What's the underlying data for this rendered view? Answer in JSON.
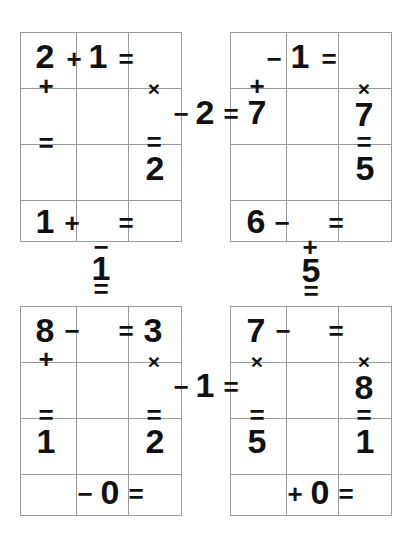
{
  "page": {
    "background_color": "#ffffff",
    "ink_color": "#111111",
    "grid_line_color": "#9a9a9a",
    "width": 411,
    "height": 544
  },
  "blocks": [
    {
      "id": "top-left",
      "rows": 4,
      "cols": 3
    },
    {
      "id": "top-right",
      "rows": 4,
      "cols": 3
    },
    {
      "id": "bottom-left",
      "rows": 4,
      "cols": 3
    },
    {
      "id": "bottom-right",
      "rows": 4,
      "cols": 3
    }
  ],
  "glyphs": [
    {
      "id": "g01",
      "text": "2",
      "kind": "num",
      "x": 45,
      "y": 56,
      "block": "top-left"
    },
    {
      "id": "g02",
      "text": "+",
      "kind": "op",
      "x": 74,
      "y": 59,
      "block": "top-left"
    },
    {
      "id": "g03",
      "text": "1",
      "kind": "num",
      "x": 98,
      "y": 56,
      "block": "top-left"
    },
    {
      "id": "g04",
      "text": "=",
      "kind": "eq",
      "x": 126,
      "y": 59,
      "block": "top-left"
    },
    {
      "id": "g05",
      "text": "+",
      "kind": "op",
      "x": 46,
      "y": 86,
      "block": "top-left"
    },
    {
      "id": "g06",
      "text": "×",
      "kind": "opsm",
      "x": 154,
      "y": 88,
      "block": "top-left"
    },
    {
      "id": "g07",
      "text": "=",
      "kind": "eq",
      "x": 46,
      "y": 143,
      "block": "top-left"
    },
    {
      "id": "g08",
      "text": "=",
      "kind": "eq",
      "x": 154,
      "y": 142,
      "block": "top-left"
    },
    {
      "id": "g09",
      "text": "2",
      "kind": "num",
      "x": 155,
      "y": 168,
      "block": "top-left"
    },
    {
      "id": "g10",
      "text": "1",
      "kind": "num",
      "x": 45,
      "y": 221,
      "block": "top-left"
    },
    {
      "id": "g11",
      "text": "+",
      "kind": "op",
      "x": 72,
      "y": 223,
      "block": "top-left"
    },
    {
      "id": "g12",
      "text": "=",
      "kind": "eq",
      "x": 126,
      "y": 223,
      "block": "top-left"
    },
    {
      "id": "g13",
      "text": "−",
      "kind": "op",
      "x": 274,
      "y": 59,
      "block": "top-right"
    },
    {
      "id": "g14",
      "text": "1",
      "kind": "num",
      "x": 300,
      "y": 56,
      "block": "top-right"
    },
    {
      "id": "g15",
      "text": "=",
      "kind": "eq",
      "x": 329,
      "y": 59,
      "block": "top-right"
    },
    {
      "id": "g16",
      "text": "+",
      "kind": "op",
      "x": 257,
      "y": 86,
      "block": "top-right"
    },
    {
      "id": "g17",
      "text": "×",
      "kind": "opsm",
      "x": 364,
      "y": 88,
      "block": "top-right"
    },
    {
      "id": "g18",
      "text": "7",
      "kind": "num",
      "x": 364,
      "y": 114,
      "block": "top-right"
    },
    {
      "id": "g19",
      "text": "=",
      "kind": "eq",
      "x": 364,
      "y": 142,
      "block": "top-right"
    },
    {
      "id": "g20",
      "text": "5",
      "kind": "num",
      "x": 365,
      "y": 168,
      "block": "top-right"
    },
    {
      "id": "g21",
      "text": "6",
      "kind": "num",
      "x": 256,
      "y": 221,
      "block": "top-right"
    },
    {
      "id": "g22",
      "text": "−",
      "kind": "op",
      "x": 282,
      "y": 223,
      "block": "top-right"
    },
    {
      "id": "g23",
      "text": "=",
      "kind": "eq",
      "x": 336,
      "y": 223,
      "block": "top-right"
    },
    {
      "id": "g24",
      "text": "8",
      "kind": "num",
      "x": 45,
      "y": 330,
      "block": "bottom-left"
    },
    {
      "id": "g25",
      "text": "−",
      "kind": "op",
      "x": 72,
      "y": 331,
      "block": "bottom-left"
    },
    {
      "id": "g26",
      "text": "=",
      "kind": "eq",
      "x": 126,
      "y": 331,
      "block": "bottom-left"
    },
    {
      "id": "g27",
      "text": "3",
      "kind": "num",
      "x": 153,
      "y": 330,
      "block": "bottom-left"
    },
    {
      "id": "g28",
      "text": "+",
      "kind": "op",
      "x": 46,
      "y": 359,
      "block": "bottom-left"
    },
    {
      "id": "g29",
      "text": "×",
      "kind": "opsm",
      "x": 154,
      "y": 361,
      "block": "bottom-left"
    },
    {
      "id": "g30",
      "text": "=",
      "kind": "eq",
      "x": 46,
      "y": 415,
      "block": "bottom-left"
    },
    {
      "id": "g31",
      "text": "1",
      "kind": "num",
      "x": 46,
      "y": 441,
      "block": "bottom-left"
    },
    {
      "id": "g32",
      "text": "=",
      "kind": "eq",
      "x": 154,
      "y": 415,
      "block": "bottom-left"
    },
    {
      "id": "g33",
      "text": "2",
      "kind": "num",
      "x": 155,
      "y": 441,
      "block": "bottom-left"
    },
    {
      "id": "g34",
      "text": "−",
      "kind": "op",
      "x": 85,
      "y": 494,
      "block": "bottom-left"
    },
    {
      "id": "g35",
      "text": "0",
      "kind": "num",
      "x": 110,
      "y": 492,
      "block": "bottom-left"
    },
    {
      "id": "g36",
      "text": "=",
      "kind": "eq",
      "x": 136,
      "y": 494,
      "block": "bottom-left"
    },
    {
      "id": "g37",
      "text": "7",
      "kind": "num",
      "x": 256,
      "y": 330,
      "block": "bottom-right"
    },
    {
      "id": "g38",
      "text": "−",
      "kind": "op",
      "x": 283,
      "y": 331,
      "block": "bottom-right"
    },
    {
      "id": "g39",
      "text": "=",
      "kind": "eq",
      "x": 336,
      "y": 331,
      "block": "bottom-right"
    },
    {
      "id": "g40",
      "text": "×",
      "kind": "opsm",
      "x": 257,
      "y": 361,
      "block": "bottom-right"
    },
    {
      "id": "g41",
      "text": "×",
      "kind": "opsm",
      "x": 364,
      "y": 361,
      "block": "bottom-right"
    },
    {
      "id": "g42",
      "text": "8",
      "kind": "num",
      "x": 364,
      "y": 387,
      "block": "bottom-right"
    },
    {
      "id": "g43",
      "text": "=",
      "kind": "eq",
      "x": 257,
      "y": 415,
      "block": "bottom-right"
    },
    {
      "id": "g44",
      "text": "5",
      "kind": "num",
      "x": 257,
      "y": 441,
      "block": "bottom-right"
    },
    {
      "id": "g45",
      "text": "=",
      "kind": "eq",
      "x": 364,
      "y": 415,
      "block": "bottom-right"
    },
    {
      "id": "g46",
      "text": "1",
      "kind": "num",
      "x": 365,
      "y": 441,
      "block": "bottom-right"
    },
    {
      "id": "g47",
      "text": "+",
      "kind": "op",
      "x": 295,
      "y": 494,
      "block": "bottom-right"
    },
    {
      "id": "g48",
      "text": "0",
      "kind": "num",
      "x": 320,
      "y": 492,
      "block": "bottom-right"
    },
    {
      "id": "g49",
      "text": "=",
      "kind": "eq",
      "x": 346,
      "y": 494,
      "block": "bottom-right"
    },
    {
      "id": "c01",
      "text": "−",
      "kind": "op",
      "x": 181,
      "y": 114,
      "block": "connector-horizontal-top"
    },
    {
      "id": "c02",
      "text": "2",
      "kind": "num",
      "x": 205,
      "y": 112,
      "block": "connector-horizontal-top"
    },
    {
      "id": "c03",
      "text": "=",
      "kind": "eq",
      "x": 231,
      "y": 114,
      "block": "connector-horizontal-top"
    },
    {
      "id": "c04",
      "text": "7",
      "kind": "num",
      "x": 257,
      "y": 112,
      "block": "connector-horizontal-top"
    },
    {
      "id": "c05",
      "text": "−",
      "kind": "op",
      "x": 181,
      "y": 387,
      "block": "connector-horizontal-bottom"
    },
    {
      "id": "c06",
      "text": "1",
      "kind": "num",
      "x": 205,
      "y": 385,
      "block": "connector-horizontal-bottom"
    },
    {
      "id": "c07",
      "text": "=",
      "kind": "eq",
      "x": 231,
      "y": 387,
      "block": "connector-horizontal-bottom"
    },
    {
      "id": "c08",
      "text": "−",
      "kind": "op",
      "x": 101,
      "y": 247,
      "block": "connector-vertical-left"
    },
    {
      "id": "c09",
      "text": "1",
      "kind": "num",
      "x": 101,
      "y": 268,
      "block": "connector-vertical-left"
    },
    {
      "id": "c10",
      "text": "=",
      "kind": "eq",
      "x": 101,
      "y": 289,
      "block": "connector-vertical-left"
    },
    {
      "id": "c11",
      "text": "+",
      "kind": "op",
      "x": 310,
      "y": 247,
      "block": "connector-vertical-right"
    },
    {
      "id": "c12",
      "text": "5",
      "kind": "num",
      "x": 311,
      "y": 270,
      "block": "connector-vertical-right"
    },
    {
      "id": "c13",
      "text": "=",
      "kind": "eq",
      "x": 311,
      "y": 291,
      "block": "connector-vertical-right"
    }
  ],
  "equations": {
    "top_left_horizontal_row1": "2 + 1 =",
    "top_left_horizontal_row4": "1 + =",
    "top_left_vertical_col1": "2 + =",
    "top_left_vertical_col3": "× = 2",
    "top_right_horizontal_row1": "− 1 =",
    "top_right_horizontal_row4": "6 − =",
    "top_right_vertical_col1": "+ 7 =",
    "top_right_vertical_col3": "× 7 = 5",
    "bottom_left_horizontal_row1": "8 − = 3",
    "bottom_left_horizontal_row4": "− 0 =",
    "bottom_left_vertical_col1": "8 + = 1",
    "bottom_left_vertical_col3": "3 × = 2",
    "bottom_right_horizontal_row1": "7 − =",
    "bottom_right_horizontal_row4": "+ 0 =",
    "bottom_right_vertical_col1": "7 × = 5",
    "bottom_right_vertical_col3": "× 8 = 1",
    "bridge_top": "− 2 = 7",
    "bridge_bottom": "− 1 =",
    "bridge_left": "− 1 =",
    "bridge_right": "+ 5 ="
  }
}
